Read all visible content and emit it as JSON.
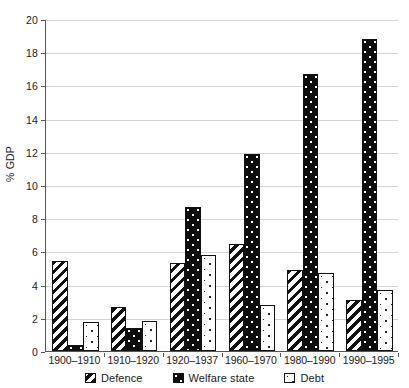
{
  "chart_data": {
    "type": "bar",
    "title": "",
    "subtitle": "",
    "xlabel": "",
    "ylabel": "% GDP",
    "ylim": [
      0,
      20
    ],
    "ytick_step": 2,
    "grid": true,
    "legend_position": "bottom",
    "categories": [
      "1900–1910",
      "1910–1920",
      "1920–1937",
      "1960–1970",
      "1980–1990",
      "1990–1995"
    ],
    "series": [
      {
        "name": "Defence",
        "pattern": "diagonal-stripes",
        "values": [
          5.4,
          2.65,
          5.3,
          6.45,
          4.9,
          3.05
        ]
      },
      {
        "name": "Welfare state",
        "pattern": "black-dotted",
        "values": [
          0.35,
          1.4,
          8.7,
          11.85,
          16.7,
          18.8
        ]
      },
      {
        "name": "Debt",
        "pattern": "light-speckled",
        "values": [
          1.75,
          1.8,
          5.8,
          2.75,
          4.7,
          3.7
        ]
      }
    ],
    "ytick_labels": [
      "0",
      "2",
      "4",
      "6",
      "8",
      "10",
      "12",
      "14",
      "16",
      "18",
      "20"
    ]
  },
  "axis": {
    "y_title": "% GDP"
  },
  "legend": {
    "items": [
      {
        "label": "Defence"
      },
      {
        "label": "Welfare state"
      },
      {
        "label": "Debt"
      }
    ]
  },
  "colors": {
    "ink": "#111111",
    "gridline": "#d4d4d4",
    "axis": "#555555",
    "background": "#ffffff"
  }
}
